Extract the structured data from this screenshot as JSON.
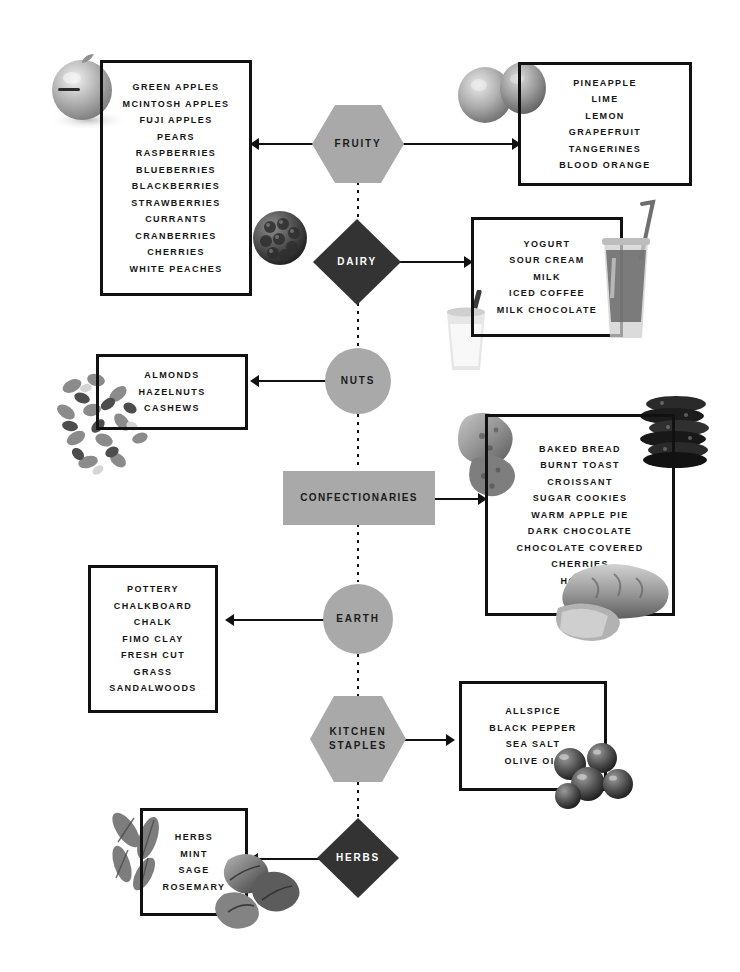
{
  "page": {
    "background_color": "#ffffff",
    "width": 740,
    "height": 972
  },
  "palette": {
    "shape_gray": "#a9a9a9",
    "shape_dark": "#333333",
    "line_black": "#111111",
    "text_dark": "#151515",
    "text_light": "#ffffff"
  },
  "nodes": [
    {
      "id": "fruity",
      "label": "FRUITY",
      "shape": "hexagon",
      "fill": "gray",
      "text": "dark"
    },
    {
      "id": "dairy",
      "label": "DAIRY",
      "shape": "diamond",
      "fill": "dark",
      "text": "light"
    },
    {
      "id": "nuts",
      "label": "NUTS",
      "shape": "circle",
      "fill": "gray",
      "text": "dark"
    },
    {
      "id": "confectionaries",
      "label": "CONFECTIONARIES",
      "shape": "rect",
      "fill": "gray",
      "text": "dark"
    },
    {
      "id": "earth",
      "label": "EARTH",
      "shape": "circle",
      "fill": "gray",
      "text": "dark"
    },
    {
      "id": "kitchen_staples",
      "label": "KITCHEN\nSTAPLES",
      "shape": "hexagon",
      "fill": "gray",
      "text": "dark"
    },
    {
      "id": "herbs",
      "label": "HERBS",
      "shape": "diamond",
      "fill": "dark",
      "text": "light"
    }
  ],
  "node_labels": {
    "fruity": "FRUITY",
    "dairy": "DAIRY",
    "nuts": "NUTS",
    "confectionaries": "CONFECTIONARIES",
    "earth": "EARTH",
    "kitchen_staples_line1": "KITCHEN",
    "kitchen_staples_line2": "STAPLES",
    "herbs": "HERBS"
  },
  "boxes": {
    "fruity_left": {
      "items": [
        "GREEN APPLES",
        "MCINTOSH APPLES",
        "FUJI APPLES",
        "PEARS",
        "RASPBERRIES",
        "BLUEBERRIES",
        "BLACKBERRIES",
        "STRAWBERRIES",
        "CURRANTS",
        "CRANBERRIES",
        "CHERRIES",
        "WHITE PEACHES"
      ]
    },
    "fruity_right": {
      "items": [
        "PINEAPPLE",
        "LIME",
        "LEMON",
        "GRAPEFRUIT",
        "TANGERINES",
        "BLOOD ORANGE"
      ]
    },
    "dairy": {
      "items": [
        "YOGURT",
        "SOUR CREAM",
        "MILK",
        "ICED COFFEE",
        "MILK CHOCOLATE"
      ]
    },
    "nuts": {
      "items": [
        "ALMONDS",
        "HAZELNUTS",
        "CASHEWS"
      ]
    },
    "confectionaries": {
      "items": [
        "BAKED BREAD",
        "BURNT TOAST",
        "CROISSANT",
        "SUGAR COOKIES",
        "WARM APPLE PIE",
        "DARK CHOCOLATE",
        "CHOCOLATE COVERED",
        "CHERRIES",
        "HONEY"
      ]
    },
    "earth": {
      "items": [
        "POTTERY",
        "CHALKBOARD",
        "CHALK",
        "FIMO CLAY",
        "FRESH CUT",
        "GRASS",
        "SANDALWOODS"
      ]
    },
    "kitchen_staples": {
      "items": [
        "ALLSPICE",
        "BLACK PEPPER",
        "SEA SALT",
        "OLIVE OIL"
      ]
    },
    "herbs": {
      "items": [
        "HERBS",
        "MINT",
        "SAGE",
        "ROSEMARY"
      ]
    }
  },
  "decorations": [
    {
      "id": "apple-photo",
      "name": "green-apple-photo"
    },
    {
      "id": "blackberry-photo",
      "name": "blackberry-photo"
    },
    {
      "id": "citrus-photo",
      "name": "citrus-fruit-photo"
    },
    {
      "id": "iced-drink-photo",
      "name": "iced-coffee-cup-photo"
    },
    {
      "id": "milk-glass-photo",
      "name": "milk-glass-photo"
    },
    {
      "id": "nuts-photo",
      "name": "mixed-nuts-photo"
    },
    {
      "id": "bread-chunk-photo",
      "name": "bread-chunk-photo"
    },
    {
      "id": "cookie-stack-photo",
      "name": "cookie-stack-photo"
    },
    {
      "id": "loaf-photo",
      "name": "bread-loaf-photo"
    },
    {
      "id": "olives-photo",
      "name": "olives-photo"
    },
    {
      "id": "sage-photo",
      "name": "sage-leaves-photo"
    },
    {
      "id": "mint-photo",
      "name": "mint-leaves-photo"
    }
  ]
}
